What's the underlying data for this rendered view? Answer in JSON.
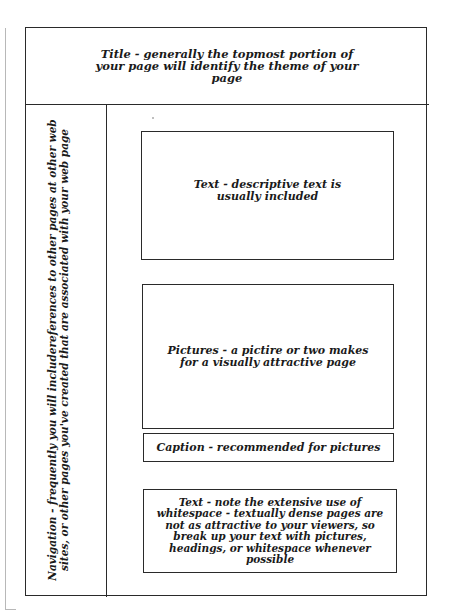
{
  "title_region": {
    "text": "Title - generally the  topmost portion of your page will identify the theme of your page"
  },
  "navigation_region": {
    "text": "Navigation - frequently you will includereferences to other pages at other web sites, or other pages you've created that are associated with your web page"
  },
  "content_boxes": [
    {
      "label": "Text - descriptive text  is usually included"
    },
    {
      "label": "Pictures  - a pictire or two makes for a visually attractive page"
    },
    {
      "label": "Caption - recommended for pictures"
    },
    {
      "label": "Text - note the extensive use of whitespace - textually dense pages are not as attractive to your viewers, so break up your text  with pictures, headings, or whitespace whenever possible"
    }
  ],
  "colors": {
    "line": "#2a2a2a",
    "background": "#ffffff",
    "scan_edge": "#b8b8b8"
  }
}
